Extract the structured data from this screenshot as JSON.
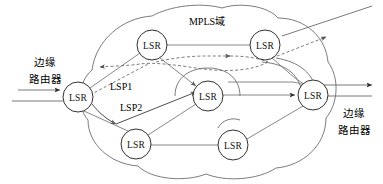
{
  "figure": {
    "type": "network-diagram",
    "title": "MPLS域",
    "background": "#ffffff",
    "width": 383,
    "height": 184
  },
  "labels": {
    "domain": "MPLS域",
    "left_edge_router_line1": "边缘",
    "left_edge_router_line2": "路由器",
    "right_edge_router_line1": "边缘",
    "right_edge_router_line2": "路由器",
    "lsp1": "LSP1",
    "lsp2": "LSP2"
  },
  "nodes": [
    {
      "id": "lsr-west",
      "label": "LSR",
      "cx": 78,
      "cy": 97,
      "r": 15
    },
    {
      "id": "lsr-north-w",
      "label": "LSR",
      "cx": 152,
      "cy": 45,
      "r": 15
    },
    {
      "id": "lsr-north-e",
      "label": "LSR",
      "cx": 265,
      "cy": 45,
      "r": 15
    },
    {
      "id": "lsr-center",
      "label": "LSR",
      "cx": 208,
      "cy": 96,
      "r": 15
    },
    {
      "id": "lsr-east",
      "label": "LSR",
      "cx": 313,
      "cy": 95,
      "r": 15
    },
    {
      "id": "lsr-south-w",
      "label": "LSR",
      "cx": 136,
      "cy": 144,
      "r": 15
    },
    {
      "id": "lsr-south-e",
      "label": "LSR",
      "cx": 233,
      "cy": 145,
      "r": 15
    }
  ],
  "links": [
    {
      "from": "lsr-north-w",
      "to": "lsr-north-e",
      "style": "solid"
    },
    {
      "from": "lsr-west",
      "to": "lsr-north-w",
      "style": "solid"
    },
    {
      "from": "lsr-west",
      "to": "lsr-south-w",
      "style": "solid"
    },
    {
      "from": "lsr-north-w",
      "to": "lsr-center",
      "style": "solid-arrow"
    },
    {
      "from": "lsr-center",
      "to": "lsr-east",
      "style": "solid-arrow"
    },
    {
      "from": "lsr-south-w",
      "to": "lsr-center",
      "style": "solid"
    },
    {
      "from": "lsr-south-w",
      "to": "lsr-south-e",
      "style": "solid"
    },
    {
      "from": "lsr-south-e",
      "to": "lsr-east",
      "style": "solid"
    },
    {
      "from": "lsr-north-e",
      "to": "lsr-east",
      "style": "solid"
    },
    {
      "from": "lsr-west",
      "to": "lsr-center",
      "style": "solid-arrow-lsp2"
    }
  ],
  "paths": [
    {
      "id": "lsp1",
      "label": "LSP1",
      "style": "dashed",
      "direction": "right-to-left"
    },
    {
      "id": "lsp2",
      "label": "LSP2",
      "style": "solid",
      "direction": "left-to-right"
    }
  ],
  "external_links": {
    "left_in_upper": "arrow-into-lsr-west",
    "left_in_lower": "line-into-lsr-west",
    "right_out_upper": "arrow-out-right",
    "right_out_lower": "line-out-right",
    "top_right_out": "line-out-top-right",
    "top_right_dashed_out": "dashed-arrow-out-top-right"
  },
  "colors": {
    "stroke": "#5a5a5a",
    "node_stroke": "#1a1a1a",
    "text": "#000000",
    "background": "#ffffff"
  }
}
